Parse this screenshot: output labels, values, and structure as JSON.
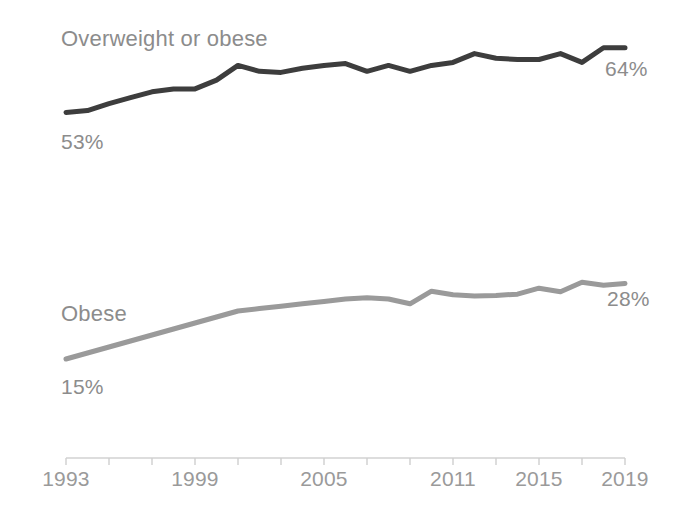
{
  "chart_data": {
    "type": "line",
    "title": "",
    "subtitle": "",
    "xlabel": "",
    "ylabel": "",
    "grid": false,
    "legend_position": "inline-labels",
    "xlim": [
      1993,
      2019
    ],
    "ylim": [
      0,
      70
    ],
    "x_ticks": [
      "1993",
      "1995",
      "1997",
      "1999",
      "2001",
      "2003",
      "2005",
      "2007",
      "2009",
      "2011",
      "2013",
      "2015",
      "2017",
      "2019"
    ],
    "x_tick_labels_shown": [
      "1993",
      "1999",
      "2005",
      "2011",
      "2015",
      "2019"
    ],
    "x": [
      1993,
      1994,
      1995,
      1996,
      1997,
      1998,
      1999,
      2000,
      2001,
      2002,
      2003,
      2004,
      2005,
      2006,
      2007,
      2008,
      2009,
      2010,
      2011,
      2012,
      2013,
      2014,
      2015,
      2016,
      2017,
      2018,
      2019
    ],
    "series": [
      {
        "name": "Overweight or obese",
        "color": "#3d3d3d",
        "start_label": "53%",
        "end_label": "64%",
        "values": [
          53,
          53.3,
          54.5,
          55.5,
          56.5,
          57,
          57,
          58.5,
          61,
          60,
          59.8,
          60.5,
          61,
          61.3,
          60,
          61,
          60,
          61,
          61.5,
          63,
          62.2,
          62,
          62,
          63,
          61.5,
          64,
          64
        ]
      },
      {
        "name": "Obese",
        "color": "#9a9a9a",
        "start_label": "15%",
        "end_label": "28%",
        "values": [
          15,
          16,
          17,
          18,
          19,
          20,
          21,
          22,
          23,
          23.4,
          23.8,
          24.2,
          24.6,
          25,
          25.2,
          25,
          24.2,
          26.3,
          25.7,
          25.5,
          25.6,
          25.8,
          26.8,
          26.2,
          27.8,
          27.3,
          27.6
        ]
      }
    ]
  },
  "axis": {
    "line_color": "#cfcfcf",
    "tick_color": "#cfcfcf"
  }
}
